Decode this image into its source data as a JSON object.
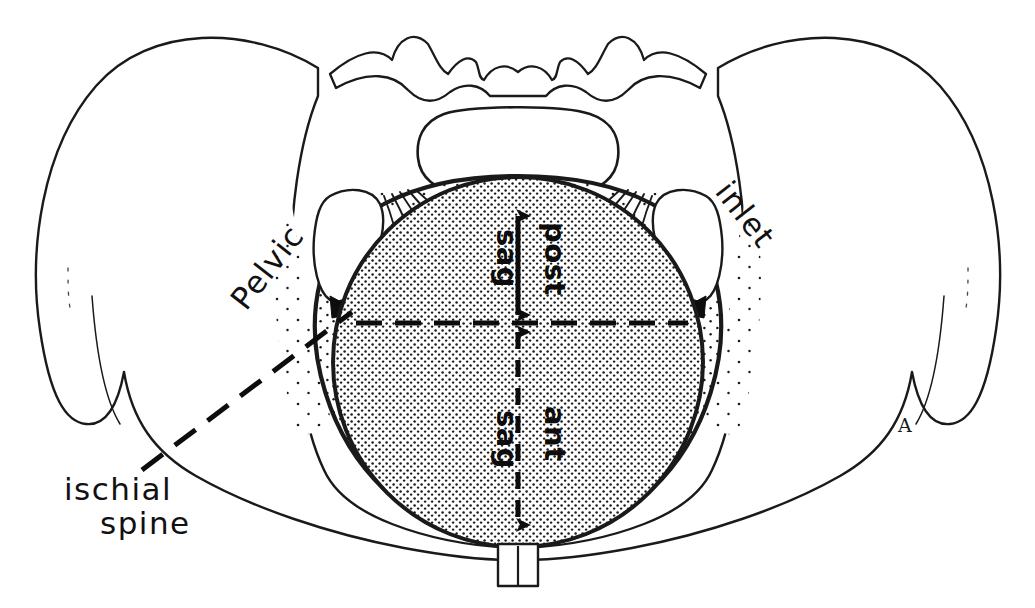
{
  "figure": {
    "background_color": "#ffffff",
    "ink_color": "#1a1a1a",
    "stipple_color": "#1a1a1a"
  },
  "labels": {
    "pelvic": "Pelvic",
    "inlet": "inlet",
    "ischial_spine_line1": "ischial",
    "ischial_spine_line2": "spine",
    "signature": "A"
  },
  "axis_labels": {
    "post_sag": "sag",
    "post": "post",
    "ant_sag": "sag",
    "ant": "ant"
  },
  "measurements": {
    "posterior_sagittal": {
      "name": "post sag",
      "style": "solid double-headed arrow",
      "from_y": 208,
      "to_y": 323
    },
    "anterior_sagittal": {
      "name": "ant sag",
      "style": "dashed double-headed arrow",
      "from_y": 323,
      "to_y": 533
    },
    "interspinous": {
      "name": "interspinous diameter",
      "style": "dashed horizontal line",
      "from_x": 356,
      "to_x": 688,
      "y": 323
    }
  }
}
